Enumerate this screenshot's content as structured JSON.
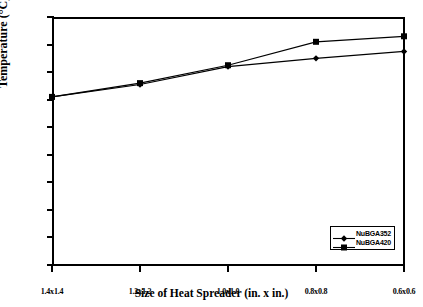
{
  "chart_data": {
    "type": "line",
    "title": "",
    "xlabel": "Size of Heat Spreader (in. x in.)",
    "ylabel": "Temperature (°C)",
    "categories": [
      "1.4x1.4",
      "1.2x1.2",
      "1.0x1.0",
      "0.8x0.8",
      "0.6x0.6"
    ],
    "ylim": [
      0.0,
      9.0
    ],
    "yticks": [
      "0.0",
      "1.0",
      "2.0",
      "3.0",
      "4.0",
      "5.0",
      "6.0",
      "7.0",
      "8.0",
      "9.0"
    ],
    "ytick_values": [
      0.0,
      1.0,
      2.0,
      3.0,
      4.0,
      5.0,
      6.0,
      7.0,
      8.0,
      9.0
    ],
    "grid": false,
    "legend_position": "lower right inside",
    "series": [
      {
        "name": "NuBGA352",
        "marker": "diamond",
        "values": [
          6.1,
          6.55,
          7.2,
          7.5,
          7.75
        ]
      },
      {
        "name": "NuBGA420",
        "marker": "square",
        "values": [
          6.1,
          6.6,
          7.25,
          8.1,
          8.3
        ]
      }
    ]
  },
  "legend": {
    "items": [
      {
        "label": "NuBGA352",
        "marker": "diamond"
      },
      {
        "label": "NuBGA420",
        "marker": "square"
      }
    ]
  }
}
